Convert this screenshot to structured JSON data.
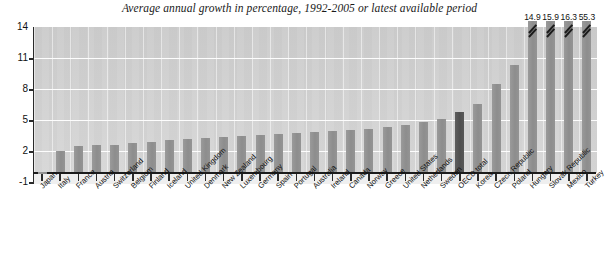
{
  "chart_data": {
    "type": "bar",
    "title": "Average annual growth in percentage, 1992-2005 or latest available period",
    "xlabel": "",
    "ylabel": "",
    "ylim": [
      -1,
      14
    ],
    "yticks": [
      -1,
      2,
      5,
      8,
      11,
      14
    ],
    "grid": true,
    "legend": null,
    "categories": [
      "Japan",
      "Italy",
      "France",
      "Austria",
      "Switzerland",
      "Belgium",
      "Finland",
      "Iceland",
      "United Kingdom",
      "Denmark",
      "New Zealand",
      "Luxembourg",
      "Germany",
      "Spain",
      "Portugal",
      "Australia",
      "Ireland",
      "Canada",
      "Norway",
      "Greece",
      "United States",
      "Netherlands",
      "Sweden",
      "OECD total",
      "Korea",
      "Czech Republic",
      "Poland",
      "Hungary",
      "Slovak Republic",
      "Mexico",
      "Turkey"
    ],
    "values": [
      -0.1,
      2.0,
      2.5,
      2.6,
      2.6,
      2.8,
      2.9,
      3.1,
      3.2,
      3.3,
      3.4,
      3.5,
      3.6,
      3.7,
      3.8,
      3.9,
      4.0,
      4.1,
      4.2,
      4.3,
      4.5,
      4.8,
      5.1,
      5.8,
      6.6,
      8.5,
      10.3,
      14.9,
      15.9,
      16.3,
      55.3
    ],
    "clipped_bars": [
      {
        "category": "Hungary",
        "label": "14.9"
      },
      {
        "category": "Slovak Republic",
        "label": "15.9"
      },
      {
        "category": "Mexico",
        "label": "16.3"
      },
      {
        "category": "Turkey",
        "label": "55.3"
      }
    ],
    "highlight_category": "OECD total",
    "colors": {
      "bar": "#8d8d8d",
      "highlight": "#4f4f4f",
      "plot_background": "#d2d2d2",
      "gridline": "#fdfdfd",
      "axis": "#1c1c1c",
      "text": "#111111"
    }
  }
}
